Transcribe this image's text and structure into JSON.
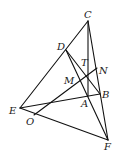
{
  "diagram": {
    "type": "geometry-figure",
    "points": {
      "C": {
        "x": 88,
        "y": 21,
        "label": "C",
        "lx": 84,
        "ly": 18
      },
      "D": {
        "x": 66,
        "y": 50,
        "label": "D",
        "lx": 57,
        "ly": 50
      },
      "T": {
        "x": 88,
        "y": 77,
        "label": "T",
        "lx": 81,
        "ly": 66
      },
      "N": {
        "x": 97,
        "y": 68,
        "label": "N",
        "lx": 99,
        "ly": 74
      },
      "M": {
        "x": 80,
        "y": 81,
        "label": "M",
        "lx": 64,
        "ly": 84
      },
      "A": {
        "x": 88,
        "y": 96,
        "label": "A",
        "lx": 81,
        "ly": 107
      },
      "B": {
        "x": 100,
        "y": 94,
        "label": "B",
        "lx": 102,
        "ly": 98
      },
      "E": {
        "x": 20,
        "y": 108,
        "label": "E",
        "lx": 9,
        "ly": 114
      },
      "O": {
        "x": 34,
        "y": 115,
        "label": "O",
        "lx": 26,
        "ly": 125
      },
      "F": {
        "x": 108,
        "y": 140,
        "label": "F",
        "lx": 104,
        "ly": 150
      }
    },
    "segments": [
      [
        "C",
        "E"
      ],
      [
        "C",
        "F"
      ],
      [
        "C",
        "A"
      ],
      [
        "D",
        "F"
      ],
      [
        "D",
        "B"
      ],
      [
        "E",
        "F"
      ],
      [
        "E",
        "B"
      ],
      [
        "O",
        "N"
      ]
    ]
  }
}
